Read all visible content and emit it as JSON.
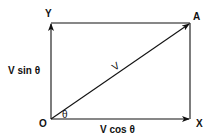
{
  "diagram": {
    "points": {
      "origin": "O",
      "x_axis": "X",
      "y_axis": "Y",
      "tip": "A"
    },
    "vector_label": "V",
    "angle_label": "θ",
    "horizontal_component": "V cos θ",
    "vertical_component": "V sin θ",
    "colors": {
      "line": "#111111",
      "background": "#ffffff"
    }
  }
}
